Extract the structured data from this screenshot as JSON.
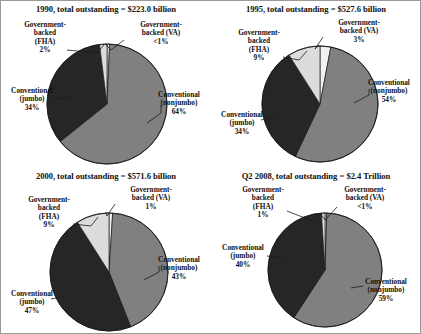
{
  "figure": {
    "background": "#ffffff",
    "border_color": "#9a9a9a"
  },
  "colors": {
    "conventional_nonjumbo": "#808080",
    "conventional_jumbo": "#262626",
    "fha": "#dcdcdc",
    "va": "#f2f2f2",
    "outline": "#1a1a1a",
    "text": "#111111"
  },
  "chart_data": [
    {
      "type": "pie",
      "title": "1990, total outstanding = $223.0 billion",
      "year": "1990",
      "total": "$223.0 billion",
      "categories": [
        "Conventional (nonjumbo)",
        "Conventional (jumbo)",
        "Government-backed (FHA)",
        "Government-backed (VA)"
      ],
      "values": [
        64,
        34,
        2,
        0.7
      ],
      "labels": [
        "64%",
        "34%",
        "2%",
        "<1%"
      ],
      "colors": [
        "#808080",
        "#262626",
        "#dcdcdc",
        "#f2f2f2"
      ],
      "legend": "none",
      "annotations": [
        {
          "name": "fha",
          "line1": "Government-",
          "line2": "backed",
          "line3": "(FHA)",
          "pct": "2%"
        },
        {
          "name": "va",
          "line1": "Government-",
          "line2": "backed (VA)",
          "line3": "",
          "pct": "<1%"
        },
        {
          "name": "jumbo",
          "line1": "Conventional",
          "line2": "(jumbo)",
          "line3": "",
          "pct": "34%"
        },
        {
          "name": "nonjumbo",
          "line1": "Conventional",
          "line2": "(nonjumbo)",
          "line3": "",
          "pct": "64%"
        }
      ]
    },
    {
      "type": "pie",
      "title": "1995, total outstanding = $527.6 billion",
      "year": "1995",
      "total": "$527.6 billion",
      "categories": [
        "Conventional (nonjumbo)",
        "Conventional (jumbo)",
        "Government-backed (FHA)",
        "Government-backed (VA)"
      ],
      "values": [
        54,
        34,
        9,
        3
      ],
      "labels": [
        "54%",
        "34%",
        "9%",
        "3%"
      ],
      "colors": [
        "#808080",
        "#262626",
        "#dcdcdc",
        "#f2f2f2"
      ],
      "legend": "none",
      "annotations": [
        {
          "name": "fha",
          "line1": "Government-",
          "line2": "backed",
          "line3": "(FHA)",
          "pct": "9%"
        },
        {
          "name": "va",
          "line1": "Government-",
          "line2": "backed (VA)",
          "line3": "",
          "pct": "3%"
        },
        {
          "name": "jumbo",
          "line1": "Conventional",
          "line2": "(jumbo)",
          "line3": "",
          "pct": "34%"
        },
        {
          "name": "nonjumbo",
          "line1": "Conventional",
          "line2": "(nonjumbo)",
          "line3": "",
          "pct": "54%"
        }
      ]
    },
    {
      "type": "pie",
      "title": "2000, total outstanding = $571.6 billion",
      "year": "2000",
      "total": "$571.6 billion",
      "categories": [
        "Conventional (nonjumbo)",
        "Conventional (jumbo)",
        "Government-backed (FHA)",
        "Government-backed (VA)"
      ],
      "values": [
        43,
        47,
        9,
        1
      ],
      "labels": [
        "43%",
        "47%",
        "9%",
        "1%"
      ],
      "colors": [
        "#808080",
        "#262626",
        "#dcdcdc",
        "#f2f2f2"
      ],
      "legend": "none",
      "annotations": [
        {
          "name": "fha",
          "line1": "Government-",
          "line2": "backed",
          "line3": "(FHA)",
          "pct": "9%"
        },
        {
          "name": "va",
          "line1": "Government-",
          "line2": "backed (VA)",
          "line3": "",
          "pct": "1%"
        },
        {
          "name": "jumbo",
          "line1": "Conventional",
          "line2": "(jumbo)",
          "line3": "",
          "pct": "47%"
        },
        {
          "name": "nonjumbo",
          "line1": "Conventional",
          "line2": "(nonjumbo)",
          "line3": "",
          "pct": "43%"
        }
      ]
    },
    {
      "type": "pie",
      "title": "Q2 2008, total outstanding = $2.4 Trillion",
      "year": "Q2 2008",
      "total": "$2.4 Trillion",
      "categories": [
        "Conventional (nonjumbo)",
        "Conventional (jumbo)",
        "Government-backed (FHA)",
        "Government-backed (VA)"
      ],
      "values": [
        59,
        40,
        1,
        0.5
      ],
      "labels": [
        "59%",
        "40%",
        "1%",
        "<1%"
      ],
      "colors": [
        "#808080",
        "#262626",
        "#dcdcdc",
        "#f2f2f2"
      ],
      "legend": "none",
      "annotations": [
        {
          "name": "fha",
          "line1": "Government-",
          "line2": "backed",
          "line3": "(FHA)",
          "pct": "1%"
        },
        {
          "name": "va",
          "line1": "Government-",
          "line2": "backed (VA)",
          "line3": "",
          "pct": "<1%"
        },
        {
          "name": "jumbo",
          "line1": "Conventional",
          "line2": "(jumbo)",
          "line3": "",
          "pct": "40%"
        },
        {
          "name": "nonjumbo",
          "line1": "Conventional",
          "line2": "(nonjumbo)",
          "line3": "",
          "pct": "59%"
        }
      ]
    }
  ]
}
